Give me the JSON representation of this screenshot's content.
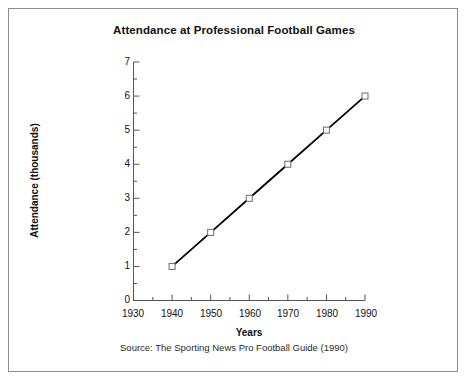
{
  "chart_data": {
    "type": "line",
    "title": "Attendance at Professional Football Games",
    "xlabel": "Years",
    "ylabel": "Attendance (thousands)",
    "source": "Source: The Sporting News Pro Football Guide (1990)",
    "x": [
      1940,
      1950,
      1960,
      1970,
      1980,
      1990
    ],
    "values": [
      1,
      2,
      3,
      4,
      5,
      6
    ],
    "series": [
      {
        "name": "Attendance",
        "x": [
          1940,
          1950,
          1960,
          1970,
          1980,
          1990
        ],
        "values": [
          1,
          2,
          3,
          4,
          5,
          6
        ]
      }
    ],
    "xlim": [
      1930,
      1990
    ],
    "ylim": [
      0,
      7
    ],
    "xticks": [
      1930,
      1940,
      1950,
      1960,
      1970,
      1980,
      1990
    ],
    "xtick_labels": [
      "1930",
      "1940",
      "1950",
      "1960",
      "1970",
      "1980",
      "1990"
    ],
    "yticks": [
      0,
      1,
      2,
      3,
      4,
      5,
      6,
      7
    ],
    "ytick_labels": [
      "0",
      "1",
      "2",
      "3",
      "4",
      "5",
      "6",
      "7"
    ],
    "x_minor_ticks": [
      1935,
      1945,
      1955,
      1965,
      1975,
      1985
    ],
    "y_minor_ticks": [
      0.5,
      1.5,
      2.5,
      3.5,
      4.5,
      5.5,
      6.5
    ],
    "grid": false,
    "legend": false,
    "marker": "open-square",
    "line_color": "#000000",
    "marker_color": "#6b6b6b",
    "axis_color": "#555555",
    "background": "#ffffff",
    "border_color": "#8d8d8d"
  }
}
